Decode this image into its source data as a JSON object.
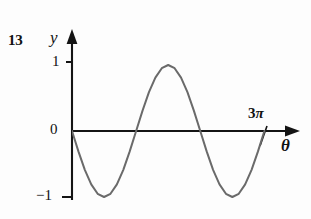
{
  "figure": {
    "number": "13",
    "background_color": "#fdfdfd",
    "axis_color": "#141414",
    "curve_color": "#6a6a6a"
  },
  "labels": {
    "y_axis_name": "y",
    "x_axis_name": "θ",
    "tick_one": "1",
    "tick_zero": "0",
    "tick_negative_one": "−1",
    "tick_three_pi_number": "3",
    "tick_three_pi_symbol": "π"
  },
  "chart_data": {
    "type": "line",
    "title": "",
    "xlabel": "θ",
    "ylabel": "y",
    "function": "y = -sin(θ)",
    "xlim": [
      0,
      9.4247779608
    ],
    "ylim": [
      -1,
      1
    ],
    "grid": false,
    "legend": null,
    "x_tick_labels": [
      "3π"
    ],
    "x_tick_values": [
      9.4247779608
    ],
    "y_tick_labels": [
      "1",
      "0",
      "−1"
    ],
    "y_tick_values": [
      1,
      0,
      -1
    ],
    "x": [
      0.0,
      0.3141592654,
      0.6283185307,
      0.9424777961,
      1.2566370614,
      1.5707963268,
      1.8849555922,
      2.1991148575,
      2.5132741229,
      2.8274333882,
      3.1415926536,
      3.4557519189,
      3.7699111843,
      4.0840704497,
      4.398229715,
      4.7123889804,
      5.0265482457,
      5.3407075111,
      5.6548667765,
      5.9690260418,
      6.2831853072,
      6.5973445725,
      6.9115038379,
      7.2256631032,
      7.5398223686,
      7.854,
      8.1681409,
      8.4823,
      8.7964594,
      9.1106187,
      9.4247779608
    ],
    "y": [
      0.0,
      -0.309,
      -0.588,
      -0.809,
      -0.951,
      -1.0,
      -0.951,
      -0.809,
      -0.588,
      -0.309,
      0.0,
      0.309,
      0.588,
      0.809,
      0.951,
      1.0,
      0.951,
      0.809,
      0.588,
      0.309,
      0.0,
      -0.309,
      -0.588,
      -0.809,
      -0.951,
      -1.0,
      -0.951,
      -0.809,
      -0.588,
      -0.309,
      0.0
    ],
    "key_points": {
      "origin": [
        0,
        0
      ],
      "first_minimum": [
        1.5707963268,
        -1
      ],
      "first_zero_crossing": [
        3.1415926536,
        0
      ],
      "maximum": [
        4.7123889804,
        1
      ],
      "second_zero_crossing": [
        6.2831853072,
        0
      ],
      "second_minimum": [
        7.854,
        -1
      ],
      "end": [
        9.4247779608,
        0
      ]
    }
  }
}
